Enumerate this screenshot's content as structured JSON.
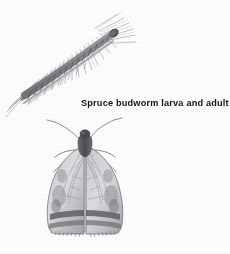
{
  "figure": {
    "caption": "Spruce budworm larva and adult",
    "background_color": "#ffffff",
    "ink_color": "#15161a",
    "art_tone_dark": "#5d5f64",
    "art_tone_mid": "#8e9095",
    "art_tone_light": "#c6c8cb",
    "width_px": 230,
    "height_px": 254,
    "medium": "halftone pen-and-ink scientific illustration"
  },
  "subjects": [
    {
      "id": "larva",
      "name": "Spruce budworm larva",
      "description": "segmented caterpillar resting along a conifer twig, oriented diagonally from lower-left to upper-right",
      "substrate": "spruce twig with needles fanning downward and to the right",
      "position": "upper-left"
    },
    {
      "id": "adult",
      "name": "Spruce budworm adult moth",
      "description": "moth viewed dorsally with wings spread in a triangular roof shape, paired antennae raised in a V, three pairs of legs, and dark transverse bands near the wing margins",
      "position": "lower-center-left"
    }
  ]
}
